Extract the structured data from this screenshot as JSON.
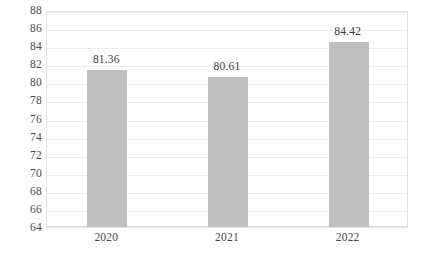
{
  "chart_data": {
    "type": "bar",
    "title": "",
    "subtitle": "",
    "xlabel": "",
    "ylabel": "",
    "categories": [
      "2020",
      "2021",
      "2022"
    ],
    "values": [
      81.36,
      80.61,
      84.42
    ],
    "data_labels": [
      "81.36",
      "80.61",
      "84.42"
    ],
    "ylim": [
      64,
      88
    ],
    "ytick_step": 2,
    "yticks": [
      "88",
      "86",
      "84",
      "82",
      "80",
      "78",
      "76",
      "74",
      "72",
      "70",
      "68",
      "66",
      "64"
    ],
    "ytick_values": [
      88,
      86,
      84,
      82,
      80,
      78,
      76,
      74,
      72,
      70,
      68,
      66,
      64
    ],
    "grid": true,
    "grid_axis": "y",
    "legend": false,
    "legend_position": "none",
    "series": [
      {
        "name": "",
        "values": [
          81.36,
          80.61,
          84.42
        ]
      }
    ],
    "colors": {
      "bar_fill": "#bfbfbf",
      "gridline": "#ededed",
      "plot_border": "#e2e2e2",
      "tick_label": "#4a4a4a",
      "data_label": "#3d3d3d",
      "background": "#ffffff"
    }
  }
}
